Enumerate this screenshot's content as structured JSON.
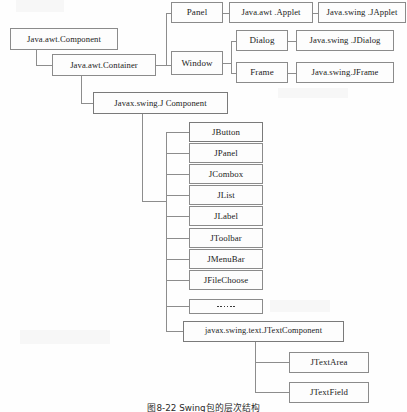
{
  "diagram": {
    "kind": "class-hierarchy",
    "caption": "图8-22  Swing包的层次结构",
    "colors": {
      "page_background": "#fefefe",
      "box_border": "#8b8b8b",
      "box_fill": "#fdfdfd",
      "connector": "#8d8d8d",
      "text": "#1b1b1b"
    },
    "nodes": {
      "component": {
        "label": "Java.awt.Component",
        "x": 10,
        "y": 28,
        "w": 108,
        "h": 22,
        "font": 8.6
      },
      "container": {
        "label": "Java.awt.Container",
        "x": 52,
        "y": 54,
        "w": 104,
        "h": 22,
        "font": 8.6
      },
      "panel": {
        "label": "Panel",
        "x": 171,
        "y": 2,
        "w": 52,
        "h": 21,
        "font": 9.0
      },
      "applet": {
        "label": "Java.awt .Applet",
        "x": 229,
        "y": 2,
        "w": 84,
        "h": 21,
        "font": 8.6
      },
      "japplet": {
        "label": "Java.swing .JApplet",
        "x": 318,
        "y": 2,
        "w": 88,
        "h": 21,
        "font": 8.6
      },
      "window": {
        "label": "Window",
        "x": 171,
        "y": 51,
        "w": 52,
        "h": 24,
        "font": 9.0
      },
      "dialog": {
        "label": "Dialog",
        "x": 236,
        "y": 30,
        "w": 52,
        "h": 21,
        "font": 9.0
      },
      "jdialog": {
        "label": "Java.swing .JDialog",
        "x": 296,
        "y": 30,
        "w": 98,
        "h": 21,
        "font": 8.6
      },
      "frame": {
        "label": "Frame",
        "x": 236,
        "y": 62,
        "w": 52,
        "h": 21,
        "font": 9.0
      },
      "jframe": {
        "label": "Java.swing.JFrame",
        "x": 296,
        "y": 62,
        "w": 98,
        "h": 21,
        "font": 8.6
      },
      "jcomponent": {
        "label": "Javax.swing.J Component",
        "x": 93,
        "y": 92,
        "w": 135,
        "h": 22,
        "font": 8.6
      },
      "jtextcomponent": {
        "label": "javax.swing.text.JTextComponent",
        "x": 183,
        "y": 321,
        "w": 161,
        "h": 21,
        "font": 8.4
      },
      "jtextarea": {
        "label": "JTextArea",
        "x": 289,
        "y": 352,
        "w": 80,
        "h": 21,
        "font": 8.8
      },
      "jtextfield": {
        "label": "JTextField",
        "x": 289,
        "y": 382,
        "w": 80,
        "h": 21,
        "font": 8.8
      }
    },
    "jcomponent_children": [
      {
        "label": "JButton",
        "x": 189,
        "y": 122,
        "w": 74,
        "h": 20,
        "font": 8.8,
        "kind": "text"
      },
      {
        "label": "JPanel",
        "x": 189,
        "y": 143,
        "w": 74,
        "h": 20,
        "font": 8.8,
        "kind": "text"
      },
      {
        "label": "JCombox",
        "x": 189,
        "y": 164,
        "w": 74,
        "h": 20,
        "font": 8.8,
        "kind": "text"
      },
      {
        "label": "JList",
        "x": 189,
        "y": 185,
        "w": 74,
        "h": 20,
        "font": 8.8,
        "kind": "text"
      },
      {
        "label": "JLabel",
        "x": 189,
        "y": 206,
        "w": 74,
        "h": 20,
        "font": 8.8,
        "kind": "text"
      },
      {
        "label": "JToolbar",
        "x": 189,
        "y": 228,
        "w": 74,
        "h": 20,
        "font": 8.8,
        "kind": "text"
      },
      {
        "label": "JMenuBar",
        "x": 189,
        "y": 249,
        "w": 74,
        "h": 20,
        "font": 8.8,
        "kind": "text"
      },
      {
        "label": "JFileChoose",
        "x": 189,
        "y": 270,
        "w": 74,
        "h": 20,
        "font": 8.8,
        "kind": "text"
      },
      {
        "label": "......",
        "x": 189,
        "y": 299,
        "w": 74,
        "h": 15,
        "font": 8.0,
        "kind": "dots",
        "dot_count": 6
      }
    ],
    "edges": [
      {
        "name": "component-to-container",
        "type": "elbow-down-right",
        "from": "Java.awt.Component",
        "to": "Java.awt.Container"
      },
      {
        "name": "container-to-panel-window",
        "type": "bus-right",
        "from": "Java.awt.Container",
        "to": "Panel, Window"
      },
      {
        "name": "panel-to-applet",
        "type": "straight",
        "from": "Panel",
        "to": "Java.awt .Applet"
      },
      {
        "name": "applet-to-japplet",
        "type": "straight",
        "from": "Java.awt .Applet",
        "to": "Java.swing .JApplet"
      },
      {
        "name": "window-to-dialog-frame",
        "type": "bus-right",
        "from": "Window",
        "to": "Dialog, Frame"
      },
      {
        "name": "dialog-to-jdialog",
        "type": "straight",
        "from": "Dialog",
        "to": "Java.swing .JDialog"
      },
      {
        "name": "frame-to-jframe",
        "type": "straight",
        "from": "Frame",
        "to": "Java.swing.JFrame"
      },
      {
        "name": "container-to-jcomponent",
        "type": "elbow-down-right",
        "from": "Java.awt.Container",
        "to": "Javax.swing.J Component"
      },
      {
        "name": "jcomponent-to-children-bus",
        "type": "bus-down-right",
        "from": "Javax.swing.J Component",
        "to": "JComponent subclass list"
      },
      {
        "name": "jtextcomponent-to-text-fields",
        "type": "bus-right",
        "from": "javax.swing.text.JTextComponent",
        "to": "JTextArea, JTextField"
      }
    ],
    "caption_style": {
      "x": 0,
      "y": 400,
      "font": 8.8
    }
  }
}
